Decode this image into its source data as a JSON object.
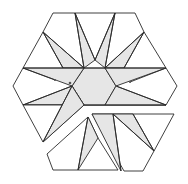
{
  "figure": {
    "colors": {
      "stroke": "#2a2a2a",
      "shade": "#e6e6e6",
      "background": "#ffffff"
    }
  }
}
